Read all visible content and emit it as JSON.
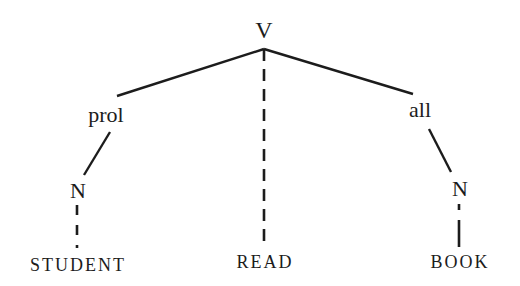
{
  "diagram": {
    "type": "syntax-tree",
    "root": {
      "label": "V"
    },
    "nodes": {
      "prol": {
        "label": "prol"
      },
      "all": {
        "label": "all"
      },
      "n_left": {
        "label": "N"
      },
      "n_right": {
        "label": "N"
      }
    },
    "leaves": {
      "student": {
        "label": "STUDENT"
      },
      "read": {
        "label": "READ"
      },
      "book": {
        "label": "BOOK"
      }
    },
    "edges": [
      {
        "from": "V",
        "to": "prol",
        "style": "solid"
      },
      {
        "from": "V",
        "to": "all",
        "style": "solid"
      },
      {
        "from": "V",
        "to": "READ",
        "style": "dashed"
      },
      {
        "from": "prol",
        "to": "N",
        "style": "solid"
      },
      {
        "from": "all",
        "to": "N",
        "style": "solid"
      },
      {
        "from": "N",
        "to": "STUDENT",
        "style": "dashed"
      },
      {
        "from": "N",
        "to": "BOOK",
        "style": "dashed"
      }
    ],
    "colors": {
      "ink": "#1c1c1c",
      "background": "#ffffff"
    }
  }
}
